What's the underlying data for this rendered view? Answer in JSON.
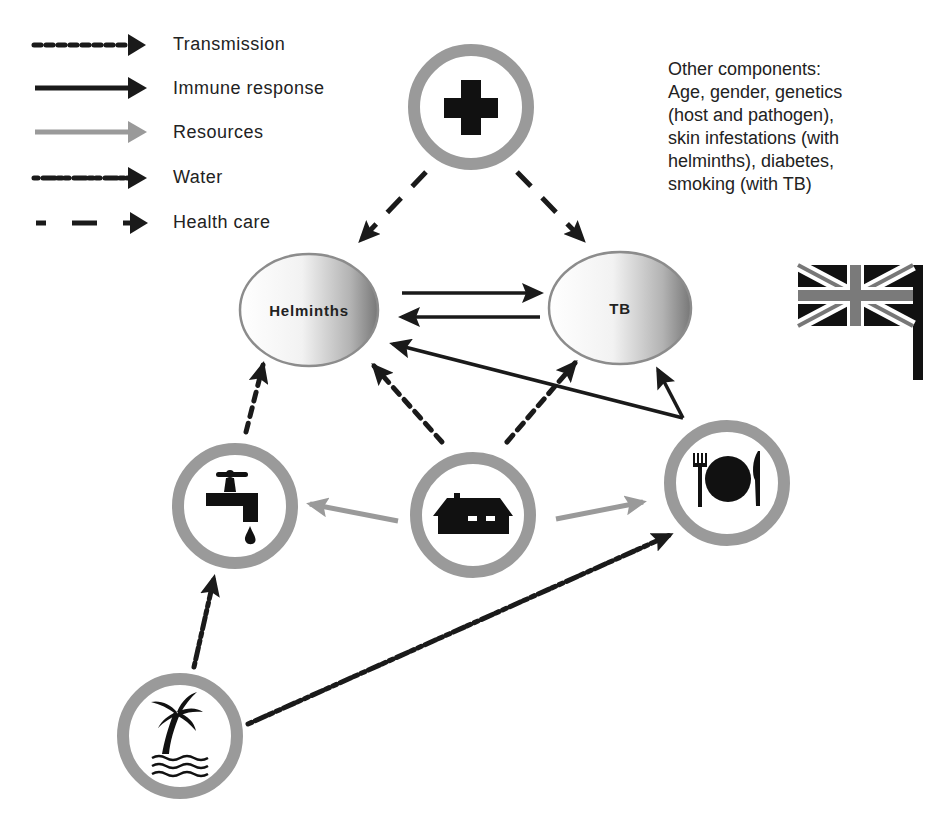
{
  "legend": {
    "items": [
      {
        "label": "Transmission",
        "style": "dotted",
        "color": "#1a1a1a"
      },
      {
        "label": "Immune response",
        "style": "solid",
        "color": "#1a1a1a"
      },
      {
        "label": "Resources",
        "style": "solid",
        "color": "#9a9a9a"
      },
      {
        "label": "Water",
        "style": "dash-dot",
        "color": "#1a1a1a"
      },
      {
        "label": "Health care",
        "style": "long-dash",
        "color": "#1a1a1a"
      }
    ]
  },
  "other_components": {
    "title": "Other components:",
    "lines": [
      "Age, gender, genetics",
      "(host and pathogen),",
      "skin infestations (with",
      "helminths), diabetes,",
      "smoking (with TB)"
    ]
  },
  "nodes": {
    "helminths": {
      "label": "Helminths"
    },
    "tb": {
      "label": "TB"
    },
    "health_care": {
      "icon": "medical-cross-icon"
    },
    "water": {
      "icon": "water-tap-icon"
    },
    "housing": {
      "icon": "house-icon"
    },
    "food": {
      "icon": "plate-cutlery-icon"
    },
    "environment": {
      "icon": "palm-tree-water-icon"
    },
    "country": {
      "icon": "uk-flag-icon"
    }
  },
  "colors": {
    "ring": "#9a9a9a",
    "arrow_dark": "#1a1a1a",
    "arrow_resource": "#9a9a9a",
    "ellipse_stroke": "#8c8c8c"
  }
}
